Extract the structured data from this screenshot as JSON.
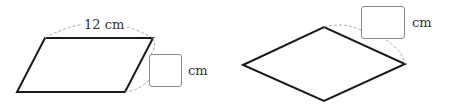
{
  "figures": [
    {
      "shape": "parallelogram",
      "top_side_label": "12 cm",
      "answer_box_value": "",
      "answer_unit": "cm"
    },
    {
      "shape": "rhombus",
      "answer_box_value": "",
      "answer_unit": "cm"
    }
  ],
  "colors": {
    "outline": "#1a1a1a",
    "dashed": "#aaaaaa",
    "box_border": "#888888"
  }
}
